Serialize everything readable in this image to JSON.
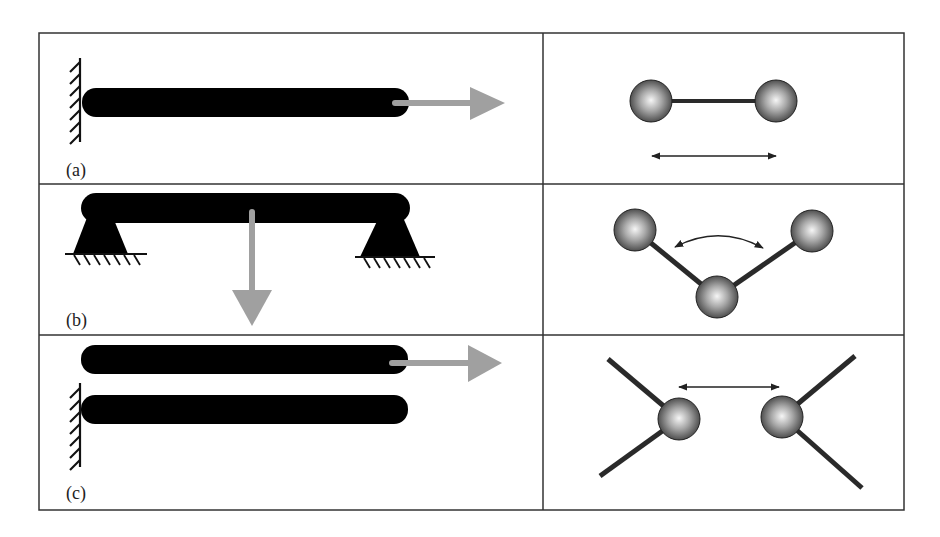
{
  "figure": {
    "panels": [
      {
        "label": "(a)",
        "mechanical": "cantilever beam fixed to wall, axial tensile force to the right",
        "molecular": "bond stretching between two atoms"
      },
      {
        "label": "(b)",
        "mechanical": "simply supported beam with downward point load at center",
        "molecular": "bond angle bending among three atoms"
      },
      {
        "label": "(c)",
        "mechanical": "two parallel beams, one fixed, other pulled sideways (sliding/shear)",
        "molecular": "non-bonded interaction between two atoms"
      }
    ]
  },
  "colors": {
    "beam": "#000000",
    "force_arrow": "#a0a0a0",
    "border": "#333333",
    "atom_light": "#f4f4f4",
    "atom_dark": "#3a3a3a",
    "bond": "#2a2a2a"
  }
}
